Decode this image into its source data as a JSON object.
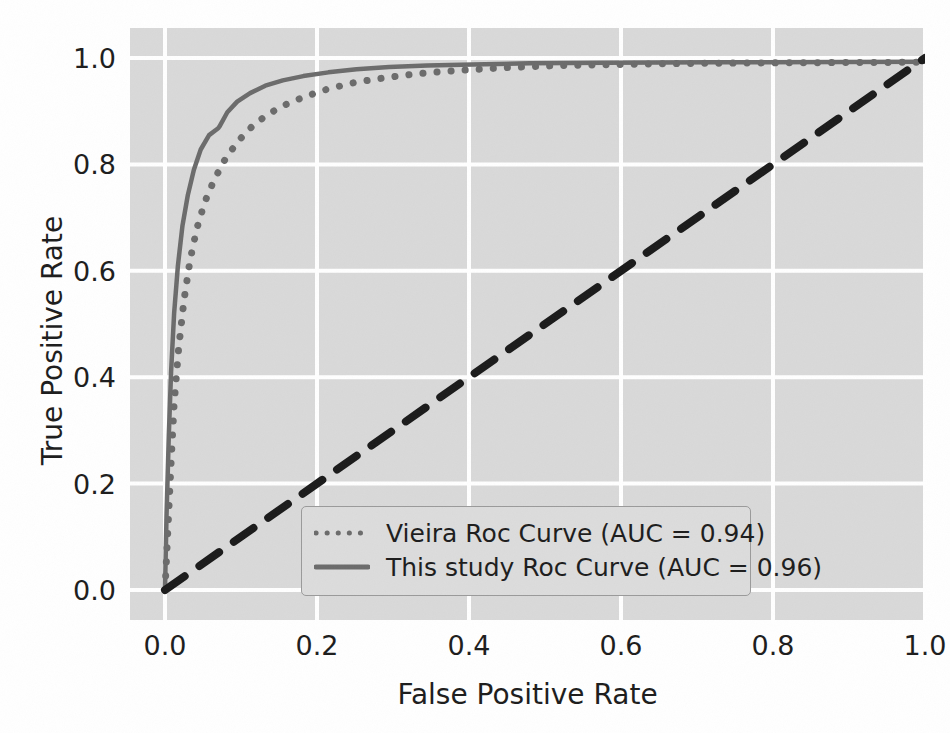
{
  "chart_data": {
    "type": "line",
    "title": "",
    "xlabel": "False Positive Rate",
    "ylabel": "True Positive Rate",
    "xlim": [
      0.0,
      1.0
    ],
    "ylim": [
      0.0,
      1.0
    ],
    "xticks": [
      "0.0",
      "0.2",
      "0.4",
      "0.6",
      "0.8",
      "1.0"
    ],
    "yticks": [
      "0.0",
      "0.2",
      "0.4",
      "0.6",
      "0.8",
      "1.0"
    ],
    "grid": true,
    "grid_color": "#ffffff",
    "plot_bg": "#d9d9d9",
    "legend_position": "lower right",
    "series": [
      {
        "name": "Vieira Roc Curve (AUC = 0.94)",
        "auc": 0.94,
        "style": "dotted",
        "color": "#6b6b6b",
        "x": [
          0.0,
          0.004,
          0.008,
          0.012,
          0.018,
          0.025,
          0.033,
          0.042,
          0.052,
          0.065,
          0.08,
          0.097,
          0.115,
          0.135,
          0.158,
          0.185,
          0.215,
          0.25,
          0.29,
          0.335,
          0.39,
          0.45,
          0.52,
          0.6,
          0.7,
          0.82,
          1.0
        ],
        "y": [
          0.0,
          0.12,
          0.24,
          0.35,
          0.455,
          0.545,
          0.62,
          0.68,
          0.728,
          0.772,
          0.812,
          0.845,
          0.872,
          0.894,
          0.912,
          0.928,
          0.942,
          0.954,
          0.963,
          0.971,
          0.977,
          0.982,
          0.986,
          0.988,
          0.99,
          0.991,
          0.992
        ]
      },
      {
        "name": "This study Roc Curve (AUC = 0.96)",
        "auc": 0.96,
        "style": "solid",
        "color": "#6b6b6b",
        "x": [
          0.0,
          0.002,
          0.005,
          0.008,
          0.012,
          0.017,
          0.023,
          0.03,
          0.038,
          0.047,
          0.058,
          0.07,
          0.072,
          0.082,
          0.095,
          0.112,
          0.132,
          0.155,
          0.182,
          0.215,
          0.252,
          0.295,
          0.345,
          0.405,
          0.48,
          0.58,
          0.72,
          1.0
        ],
        "y": [
          0.0,
          0.14,
          0.29,
          0.41,
          0.52,
          0.61,
          0.685,
          0.742,
          0.79,
          0.828,
          0.855,
          0.868,
          0.872,
          0.898,
          0.918,
          0.934,
          0.948,
          0.958,
          0.966,
          0.973,
          0.979,
          0.983,
          0.986,
          0.988,
          0.99,
          0.991,
          0.992,
          0.993
        ]
      },
      {
        "name": "chance-diagonal",
        "style": "dashed",
        "color": "#1a1a1a",
        "x": [
          0.0,
          1.0
        ],
        "y": [
          0.0,
          1.0
        ]
      }
    ],
    "legend": [
      {
        "label": "Vieira Roc Curve (AUC = 0.94)",
        "style": "dotted",
        "color": "#6b6b6b"
      },
      {
        "label": "This study Roc Curve (AUC = 0.96)",
        "style": "solid",
        "color": "#6b6b6b"
      }
    ]
  }
}
